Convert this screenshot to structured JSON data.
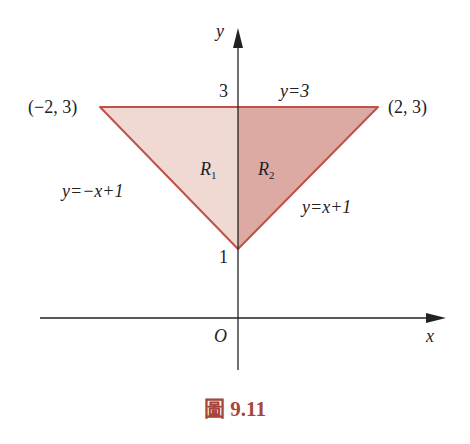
{
  "figure": {
    "caption": "圖 9.11",
    "axes": {
      "x_label": "x",
      "y_label": "y",
      "origin_label": "O",
      "y_ticks": [
        "1",
        "3"
      ]
    },
    "labels": {
      "vertex_left": "(−2, 3)",
      "vertex_right": "(2, 3)",
      "line_top": "y=3",
      "line_left": "y=−x+1",
      "line_right": "y=x+1",
      "region1": "R",
      "region1_sub": "1",
      "region2": "R",
      "region2_sub": "2"
    },
    "colors": {
      "edge": "#c0504a",
      "region1_fill": "#f1d9d3",
      "region2_fill": "#ddaaa3",
      "caption": "#a8453c",
      "axis": "#222222"
    },
    "vertices": [
      [
        -2,
        3
      ],
      [
        2,
        3
      ],
      [
        0,
        1
      ]
    ]
  }
}
